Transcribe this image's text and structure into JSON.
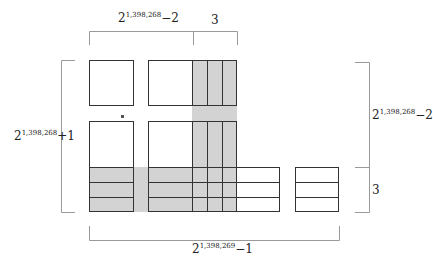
{
  "diagram": {
    "title": "",
    "labels": {
      "top_left": {
        "base": "2",
        "exp": "1,398,268",
        "suffix": "−2"
      },
      "top_right": {
        "text": "3"
      },
      "left": {
        "base": "2",
        "exp": "1,398,268",
        "suffix": "+1"
      },
      "right_top": {
        "base": "2",
        "exp": "1,398,268",
        "suffix": "−2"
      },
      "right_bottom": {
        "text": "3"
      },
      "bottom": {
        "base": "2",
        "exp": "1,398,269",
        "suffix": "−1"
      }
    },
    "colors": {
      "shade": "#d3d3d3",
      "box_line": "#333333",
      "bracket_line": "#9a9a9a",
      "background": "#ffffff"
    }
  }
}
